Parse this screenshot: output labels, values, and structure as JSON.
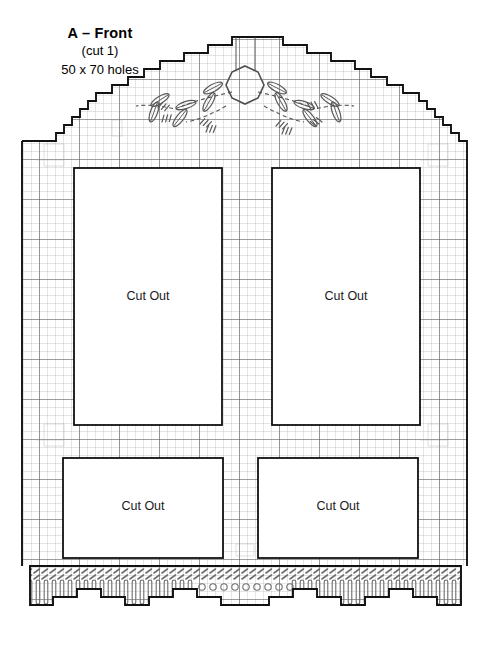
{
  "document": {
    "type": "plastic-canvas-pattern",
    "title": "A – Front",
    "subtitle": "(cut 1)",
    "size_note": "50 x 70 holes"
  },
  "labels": {
    "cut_out": "Cut Out"
  },
  "cutouts": [
    {
      "name": "upper-left",
      "label": "Cut Out",
      "x": 74,
      "y": 168,
      "w": 148,
      "h": 257,
      "cx": 148,
      "cy": 296
    },
    {
      "name": "upper-right",
      "label": "Cut Out",
      "x": 272,
      "y": 168,
      "w": 148,
      "h": 257,
      "cx": 346,
      "cy": 296
    },
    {
      "name": "lower-left",
      "label": "Cut Out",
      "x": 63,
      "y": 458,
      "w": 160,
      "h": 100,
      "cx": 143,
      "cy": 506
    },
    {
      "name": "lower-right",
      "label": "Cut Out",
      "x": 258,
      "y": 458,
      "w": 160,
      "h": 100,
      "cx": 338,
      "cy": 506
    }
  ],
  "colors": {
    "ink": "#000000",
    "grid_fine": "#b9b9b9",
    "grid_bold": "#4a4a4a",
    "outline": "#111111",
    "stitch": "#7d7d7d",
    "paper": "#ffffff"
  },
  "grid": {
    "cell_px": 8,
    "bold_every": 5,
    "holes_wide": 50,
    "holes_tall": 70
  },
  "motif": {
    "name": "central-floral-medallion",
    "center_shape": "octagon",
    "center_x": 245,
    "center_y": 90,
    "petal_count": 8
  },
  "fringe": {
    "name": "bottom-stitched-fringe",
    "top_y": 566,
    "rows": 2
  }
}
